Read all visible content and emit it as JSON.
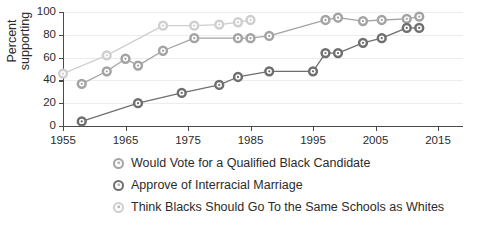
{
  "chart_data": {
    "type": "line",
    "title": "",
    "xlabel": "",
    "ylabel": "Percent\nsupporting",
    "xlim": [
      1955,
      2019
    ],
    "ylim": [
      0,
      100
    ],
    "grid": true,
    "legend_position": "bottom",
    "y_ticks": [
      0,
      20,
      40,
      60,
      80,
      100
    ],
    "x_ticks": [
      1955,
      1965,
      1975,
      1985,
      1995,
      2005,
      2015
    ],
    "series": [
      {
        "name": "Would Vote for a Qualified Black Candidate",
        "color": "#a3a3a3",
        "points": [
          {
            "x": 1958,
            "y": 37
          },
          {
            "x": 1962,
            "y": 48
          },
          {
            "x": 1965,
            "y": 59
          },
          {
            "x": 1967,
            "y": 53
          },
          {
            "x": 1971,
            "y": 66
          },
          {
            "x": 1976,
            "y": 77
          },
          {
            "x": 1983,
            "y": 77
          },
          {
            "x": 1985,
            "y": 77
          },
          {
            "x": 1988,
            "y": 79
          },
          {
            "x": 1997,
            "y": 93
          },
          {
            "x": 1999,
            "y": 95
          },
          {
            "x": 2003,
            "y": 92
          },
          {
            "x": 2006,
            "y": 93
          },
          {
            "x": 2010,
            "y": 94
          },
          {
            "x": 2012,
            "y": 96
          }
        ]
      },
      {
        "name": "Approve of Interracial Marriage",
        "color": "#6f6f6f",
        "points": [
          {
            "x": 1958,
            "y": 4
          },
          {
            "x": 1967,
            "y": 20
          },
          {
            "x": 1974,
            "y": 29
          },
          {
            "x": 1980,
            "y": 36
          },
          {
            "x": 1983,
            "y": 43
          },
          {
            "x": 1988,
            "y": 48
          },
          {
            "x": 1995,
            "y": 48
          },
          {
            "x": 1997,
            "y": 64
          },
          {
            "x": 1999,
            "y": 64
          },
          {
            "x": 2003,
            "y": 73
          },
          {
            "x": 2006,
            "y": 77
          },
          {
            "x": 2010,
            "y": 86
          },
          {
            "x": 2012,
            "y": 86
          }
        ]
      },
      {
        "name": "Think Blacks Should Go To the Same Schools as Whites",
        "color": "#cfcfcf",
        "points": [
          {
            "x": 1955,
            "y": 46
          },
          {
            "x": 1962,
            "y": 62
          },
          {
            "x": 1971,
            "y": 88
          },
          {
            "x": 1976,
            "y": 88
          },
          {
            "x": 1980,
            "y": 89
          },
          {
            "x": 1983,
            "y": 91
          },
          {
            "x": 1985,
            "y": 93
          }
        ]
      }
    ]
  }
}
